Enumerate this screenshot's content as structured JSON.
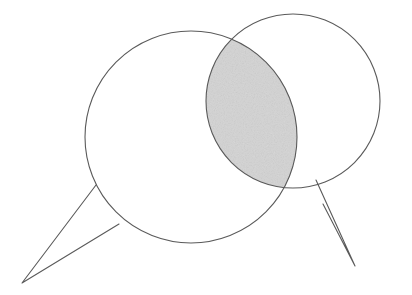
{
  "figure": {
    "caption": "Two hand-drawn circular speech balloons overlap; the lens-shaped intersection is shaded light gray.",
    "background_color": "#ffffff",
    "stroke_color": "#5a5a5a",
    "stroke_width": 1.1,
    "intersection_fill": "#dcdcdc",
    "intersection_fill_edge": "#4f4f4f",
    "canvas": {
      "width": 412,
      "height": 295
    }
  },
  "shapes": {
    "left_bubble": {
      "label": "left-speech-bubble",
      "circle": {
        "cx": 191,
        "cy": 137,
        "r": 106
      },
      "tail": {
        "label": "left-bubble-tail",
        "points": "96,185 22,283 119,224",
        "tip": {
          "x": 22,
          "y": 283
        },
        "notch_upper": {
          "x": 96,
          "y": 185
        },
        "notch_lower": {
          "x": 119,
          "y": 224
        }
      }
    },
    "right_bubble": {
      "label": "right-speech-bubble",
      "circle": {
        "cx": 293,
        "cy": 101,
        "r": 87
      },
      "tail": {
        "label": "right-bubble-tail",
        "points": "316,180 355,266 323,204",
        "tip": {
          "x": 355,
          "y": 266
        },
        "notch_upper": {
          "x": 316,
          "y": 180
        },
        "notch_lower": {
          "x": 323,
          "y": 204
        }
      }
    },
    "intersection": {
      "label": "shaded-lens-intersection",
      "upper_point": {
        "x": 238,
        "y": 41
      },
      "lower_point": {
        "x": 281,
        "y": 206
      },
      "fill": "#dcdcdc",
      "description": "lens (vesica) region where both circles overlap, filled with light gray stipple"
    }
  },
  "chart_data": {
    "type": "diagram",
    "subtype": "venn-2-set-speech-bubbles",
    "sets": [
      {
        "name": "left-bubble",
        "shape": "circle",
        "center": [
          191,
          137
        ],
        "radius": 106,
        "fill": "none",
        "stroke": "#5a5a5a",
        "has_tail": true,
        "tail_direction": "down-left"
      },
      {
        "name": "right-bubble",
        "shape": "circle",
        "center": [
          293,
          101
        ],
        "radius": 87,
        "fill": "none",
        "stroke": "#5a5a5a",
        "has_tail": true,
        "tail_direction": "down-right"
      }
    ],
    "regions": [
      {
        "name": "left-only",
        "fill": "#ffffff",
        "shaded": false
      },
      {
        "name": "right-only",
        "fill": "#ffffff",
        "shaded": false
      },
      {
        "name": "intersection",
        "fill": "#dcdcdc",
        "shaded": true
      }
    ],
    "intersection_points": [
      [
        238,
        41
      ],
      [
        281,
        206
      ]
    ],
    "labels": [],
    "legend": null,
    "grid": false
  }
}
